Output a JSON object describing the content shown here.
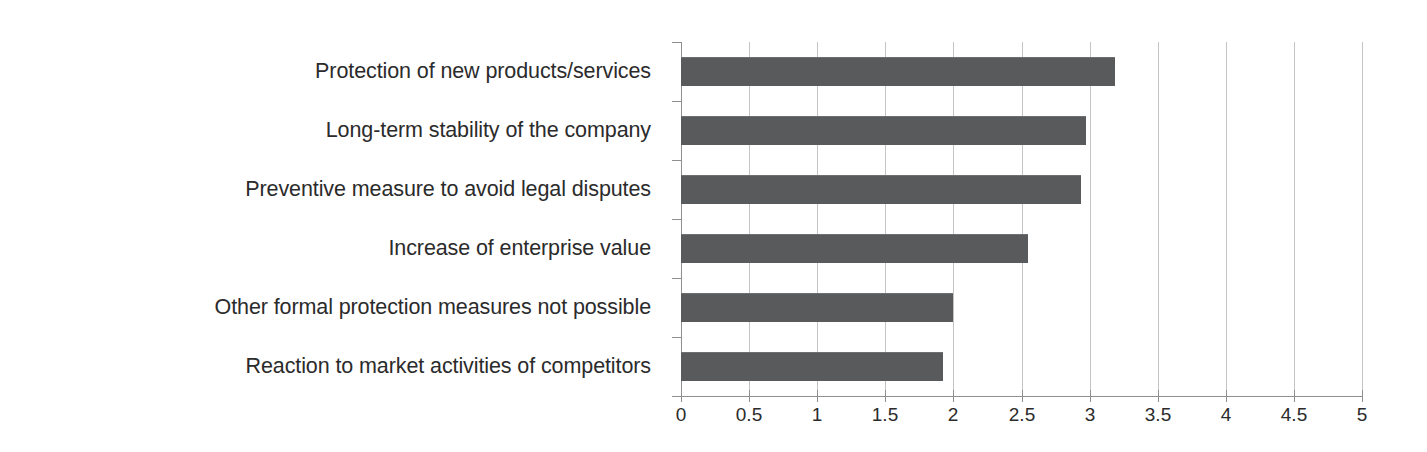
{
  "chart_data": {
    "type": "bar",
    "orientation": "horizontal",
    "title": "",
    "subtitle": "",
    "xlabel": "",
    "ylabel": "",
    "categories": [
      "Protection of new products/services",
      "Long-term stability of the company",
      "Preventive measure to avoid legal disputes",
      "Increase of enterprise value",
      "Other formal protection measures not possible",
      "Reaction to market activities of competitors"
    ],
    "values": [
      3.19,
      2.97,
      2.94,
      2.55,
      2.0,
      1.92
    ],
    "xlim": [
      0,
      5
    ],
    "x_ticks": [
      0,
      0.5,
      1,
      1.5,
      2,
      2.5,
      3,
      3.5,
      4,
      4.5,
      5
    ],
    "x_tick_labels": [
      "0",
      "0.5",
      "1",
      "1.5",
      "2",
      "2.5",
      "3",
      "3.5",
      "4",
      "4.5",
      "5"
    ],
    "grid": true,
    "grid_axis": "x",
    "legend": false,
    "legend_position": "none",
    "series": [
      {
        "name": "",
        "values": [
          3.19,
          2.97,
          2.94,
          2.55,
          2.0,
          1.92
        ]
      }
    ]
  },
  "style": {
    "bar_color": "#595a5c",
    "grid_color": "#c4c4c4",
    "axis_color": "#8f8f8f",
    "text_color": "#2b2b2b",
    "background": "#ffffff"
  }
}
